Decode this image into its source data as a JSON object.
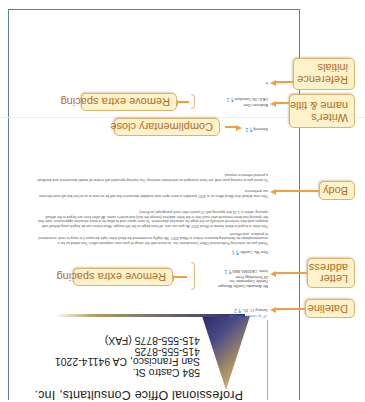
{
  "figure": {
    "orientation": "rotated-180",
    "caption_fragment": "...",
    "accent_colors": {
      "callout_fill": "#fdf2c9",
      "callout_border": "#d8b56e",
      "callout_text": "#b06d28",
      "arrow": "#f0a040",
      "page_border": "#5b7fb3",
      "formatting_marks": "#3a8ad0"
    }
  },
  "letterhead": {
    "company": "Professional Office Consultants, Inc.",
    "address_lines": [
      "584 Castro St.",
      "San Francisco, CA 94114-2201",
      "415-555-8725",
      "415-555-8775 (FAX)"
    ]
  },
  "letter": {
    "vertical_note": "↓2\" or center vertically",
    "dateline": "January 17, 20--",
    "dateline_mark": "¶ 2",
    "inside_address": [
      "Ms. Armanda Castillo, Manager",
      "Twinkle Corporation, Inc.",
      "24 Technology Drive",
      "Irvine, CA 92865-9845"
    ],
    "inside_mark": "¶ 1",
    "salutation": "Dear Ms. Castillo:",
    "salutation_mark": "¶ 1",
    "body": [
      "Thank you for selecting Professional Office Consultants, Inc. to assist with the setup of your new corporate office. You asked us for a recommendation for formatting business letters in Word 2007. We highly recommend the block letter style because it is easy to read, economical to produce, and efficient.",
      "This letter is keyed in block format in Word 2007. As you can see, all lines begin at the left margin. Most letters can be keyed using default side margins and then centered vertically on the page for attractive placement. To save space and to allow for a more attractive appearance, note that the spacing has been removed after each line in the letter address (except the last) and writer's name. All other lines are keyed in the default spacing, which is 1.15 line spacing with 10 points after each paragraph (or Enter).",
      "This new default that Word offers us in 2007 provides a more open and readable document that will be so new to us at first but will soon become our preference.",
      "To assist you in training your staff, we have arranged an orientation meeting. Our training specialist will review all model documents and distribute a printed reference manual."
    ],
    "body_mark": "¶ 1",
    "close": "Sincerely",
    "close_mark": "¶ 2",
    "writer_name": "Anderson Cline",
    "writer_title": "OA & CIS Consultant",
    "writer_mark": "¶ 1",
    "initials": "tt"
  },
  "callouts": {
    "dateline": "Dateline",
    "letter_address": [
      "Letter",
      "address"
    ],
    "remove_spacing_top": "Remove extra spacing",
    "body": "Body",
    "complimentary_close": "Complimentary close",
    "writers_name": [
      "Writer's",
      "name & title"
    ],
    "remove_spacing_bottom": "Remove extra spacing",
    "reference_initials": [
      "Reference",
      "initials"
    ]
  }
}
